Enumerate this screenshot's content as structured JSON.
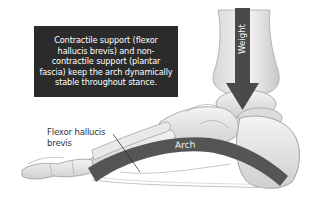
{
  "figure": {
    "type": "anatomical-illustration",
    "callout": {
      "text": "Contractile support (flexor hallucis brevis) and non-contractile support (plantar fascia) keep the arch dynamically stable throughout stance.",
      "lines": [
        "Contractile support (flexor",
        "hallucis brevis) and non-",
        "contractile support (plantar",
        "fascia) keep the arch dynamically",
        "stable throughout stance."
      ],
      "background": "#2b2b2b",
      "text_color": "#ffffff"
    },
    "labels": {
      "weight": "Weight",
      "arch": "Arch",
      "flexor_line1": "Flexor hallucis",
      "flexor_line2": "brevis"
    },
    "colors": {
      "arrow": "#4a4a4a",
      "arch_band": "#555555",
      "bone_fill": "#e4e4e4",
      "bone_stroke": "#9a9a9a",
      "background": "#ffffff"
    }
  }
}
